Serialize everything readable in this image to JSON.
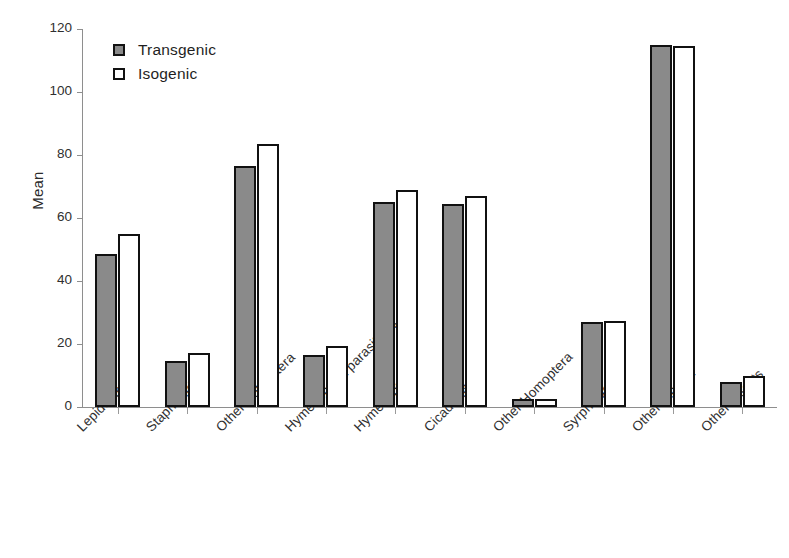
{
  "chart_data": {
    "type": "bar",
    "title": "",
    "xlabel": "",
    "ylabel": "Mean",
    "ylim": [
      0,
      120
    ],
    "ytick_values": [
      0,
      20,
      40,
      60,
      80,
      100,
      120
    ],
    "ytick_labels": [
      "0",
      "20",
      "40",
      "60",
      "80",
      "100",
      "120"
    ],
    "grid": false,
    "legend_position": "top-left-inside",
    "categories": [
      "Lepidoptera",
      "Staphilinidae",
      "Other Coleoptera",
      "Hymenoptera parasitoids",
      "Hymenoptera",
      "Cicadellidae",
      "Other Homoptera",
      "Syrphidae",
      "Other Diptera",
      "Other Insects"
    ],
    "series": [
      {
        "name": "Transgenic",
        "color": "#8a8a8a",
        "values": [
          48.5,
          14.5,
          76.5,
          16.5,
          65,
          64.5,
          2.5,
          27,
          115,
          8
        ]
      },
      {
        "name": "Isogenic",
        "color": "#ffffff",
        "values": [
          55,
          17,
          83.5,
          19.5,
          69,
          67,
          2.5,
          27.3,
          114.5,
          10
        ]
      }
    ]
  },
  "legend": {
    "items": [
      {
        "label": "Transgenic",
        "swatch": "filled-gray-square-icon"
      },
      {
        "label": "Isogenic",
        "swatch": "open-white-square-icon"
      }
    ]
  }
}
